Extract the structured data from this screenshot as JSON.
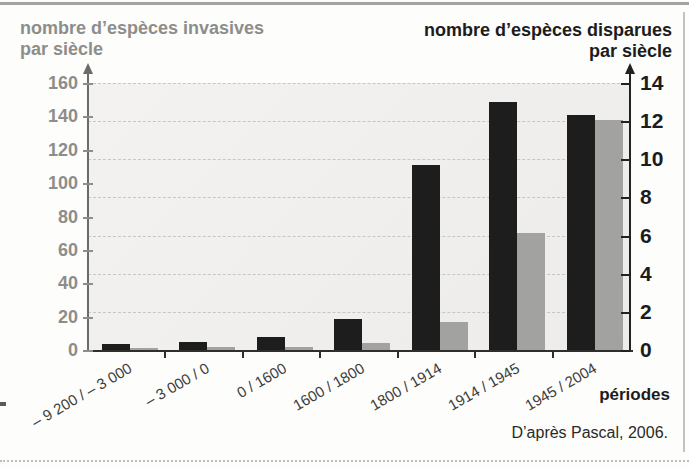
{
  "figure": {
    "left_axis_title_line1": "nombre d’espèces invasives",
    "left_axis_title_line2": "par siècle",
    "right_axis_title_line1": "nombre d’espèces disparues",
    "right_axis_title_line2": "par siècle",
    "x_axis_label": "périodes",
    "source": "D’après Pascal, 2006."
  },
  "chart_data": {
    "type": "bar",
    "categories": [
      "– 9 200 / – 3 000",
      "– 3 000 / 0",
      "0 / 1600",
      "1600 / 1800",
      "1800 / 1914",
      "1914 / 1945",
      "1945 / 2004"
    ],
    "series": [
      {
        "name": "nombre d’espèces disparues par siècle",
        "axis": "right",
        "color": "#1d1d1d",
        "values": [
          0.3,
          0.4,
          0.7,
          1.6,
          9.7,
          13,
          12.3
        ]
      },
      {
        "name": "nombre d’espèces invasives par siècle",
        "axis": "left",
        "color": "#a2a2a0",
        "values": [
          1,
          2,
          2,
          4,
          17,
          70,
          138
        ]
      }
    ],
    "left_axis": {
      "label": "nombre d’espèces invasives par siècle",
      "min": 0,
      "max": 160,
      "ticks": [
        0,
        20,
        40,
        60,
        80,
        100,
        120,
        140,
        160
      ],
      "color": "#8d8d8b"
    },
    "right_axis": {
      "label": "nombre d’espèces disparues par siècle",
      "min": 0,
      "max": 14,
      "ticks": [
        0,
        2,
        4,
        6,
        8,
        10,
        12,
        14
      ],
      "color": "#1d1d1d"
    },
    "xlabel": "périodes",
    "grid": "horizontal dashed lines at right-axis ticks",
    "legend": "none",
    "source": "D’après Pascal, 2006."
  }
}
